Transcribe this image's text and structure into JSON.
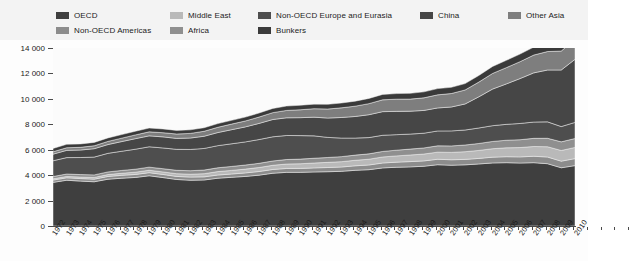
{
  "legend": {
    "rows": [
      [
        {
          "label": "OECD",
          "color": "#3f3f3f"
        },
        {
          "label": "Middle East",
          "color": "#b9b9b9"
        },
        {
          "label": "Non-OECD Europe and Eurasia",
          "color": "#4e4e4e"
        },
        {
          "label": "China",
          "color": "#464646"
        },
        {
          "label": "Other Asia",
          "color": "#7e7e7e"
        }
      ],
      [
        {
          "label": "Non-OECD Americas",
          "color": "#8c8c8c"
        },
        {
          "label": "Africa",
          "color": "#8f8f8f"
        },
        {
          "label": "Bunkers",
          "color": "#3a3a3a"
        }
      ]
    ]
  },
  "axes": {
    "y_ticks": [
      "0",
      "2 000",
      "4 000",
      "6 000",
      "8 000",
      "10 000",
      "12 000",
      "14 000"
    ],
    "y_min": 0,
    "y_max": 14000,
    "x_labels": [
      "1972",
      "1973",
      "1974",
      "1975",
      "1976",
      "1977",
      "1978",
      "1979",
      "1980",
      "1981",
      "1982",
      "1983",
      "1984",
      "1985",
      "1986",
      "1987",
      "1988",
      "1989",
      "1990",
      "1991",
      "1992",
      "1993",
      "1994",
      "1995",
      "1996",
      "1997",
      "1998",
      "1999",
      "2000",
      "2001",
      "2002",
      "2003",
      "2004",
      "2005",
      "2006",
      "2007",
      "2008",
      "2009",
      "2010"
    ]
  },
  "chart_data": {
    "type": "area",
    "title": "",
    "subtitle": "",
    "xlabel": "",
    "ylabel": "",
    "ylim": [
      0,
      14000
    ],
    "grid": false,
    "legend_position": "top",
    "stacked": true,
    "x": [
      "1972",
      "1973",
      "1974",
      "1975",
      "1976",
      "1977",
      "1978",
      "1979",
      "1980",
      "1981",
      "1982",
      "1983",
      "1984",
      "1985",
      "1986",
      "1987",
      "1988",
      "1989",
      "1990",
      "1991",
      "1992",
      "1993",
      "1994",
      "1995",
      "1996",
      "1997",
      "1998",
      "1999",
      "2000",
      "2001",
      "2002",
      "2003",
      "2004",
      "2005",
      "2006",
      "2007",
      "2008",
      "2009",
      "2010"
    ],
    "series": [
      {
        "name": "OECD",
        "color": "#3f3f3f",
        "values": [
          3430,
          3600,
          3530,
          3480,
          3680,
          3760,
          3820,
          3950,
          3810,
          3660,
          3600,
          3620,
          3760,
          3830,
          3900,
          4000,
          4150,
          4220,
          4220,
          4250,
          4270,
          4300,
          4380,
          4430,
          4570,
          4620,
          4650,
          4700,
          4820,
          4780,
          4810,
          4880,
          4960,
          4980,
          4950,
          4980,
          4900,
          4580,
          4750
        ]
      },
      {
        "name": "Non-OECD Americas",
        "color": "#8c8c8c",
        "values": [
          180,
          190,
          200,
          205,
          215,
          225,
          235,
          245,
          245,
          240,
          245,
          245,
          250,
          260,
          275,
          285,
          295,
          305,
          310,
          320,
          330,
          340,
          355,
          370,
          385,
          400,
          415,
          420,
          430,
          430,
          430,
          435,
          455,
          470,
          485,
          505,
          525,
          520,
          550
        ]
      },
      {
        "name": "Middle East",
        "color": "#b9b9b9",
        "values": [
          100,
          110,
          120,
          135,
          150,
          165,
          180,
          190,
          200,
          215,
          230,
          250,
          270,
          285,
          300,
          315,
          330,
          350,
          365,
          385,
          405,
          420,
          435,
          455,
          475,
          495,
          520,
          540,
          560,
          580,
          605,
          630,
          665,
          700,
          735,
          770,
          810,
          840,
          880
        ]
      },
      {
        "name": "Africa",
        "color": "#8f8f8f",
        "values": [
          180,
          190,
          195,
          200,
          210,
          220,
          235,
          245,
          255,
          265,
          275,
          285,
          300,
          310,
          320,
          330,
          340,
          355,
          365,
          375,
          385,
          395,
          405,
          420,
          435,
          450,
          465,
          480,
          495,
          510,
          525,
          545,
          570,
          595,
          615,
          640,
          665,
          680,
          700
        ]
      },
      {
        "name": "Non-OECD Europe and Eurasia",
        "color": "#4e4e4e",
        "values": [
          1240,
          1290,
          1340,
          1400,
          1460,
          1510,
          1570,
          1600,
          1630,
          1650,
          1670,
          1700,
          1740,
          1780,
          1820,
          1870,
          1900,
          1890,
          1850,
          1760,
          1580,
          1460,
          1340,
          1280,
          1270,
          1220,
          1180,
          1160,
          1170,
          1180,
          1180,
          1220,
          1240,
          1250,
          1280,
          1280,
          1290,
          1200,
          1270
        ]
      },
      {
        "name": "China",
        "color": "#464646",
        "values": [
          520,
          570,
          590,
          660,
          690,
          760,
          830,
          860,
          870,
          860,
          900,
          960,
          1030,
          1110,
          1180,
          1270,
          1360,
          1390,
          1410,
          1470,
          1520,
          1620,
          1700,
          1800,
          1860,
          1830,
          1800,
          1790,
          1810,
          1880,
          2050,
          2450,
          2880,
          3180,
          3530,
          3870,
          4080,
          4450,
          4960
        ]
      },
      {
        "name": "Other Asia",
        "color": "#7e7e7e",
        "values": [
          190,
          205,
          215,
          230,
          250,
          270,
          295,
          315,
          330,
          345,
          365,
          390,
          415,
          440,
          465,
          500,
          540,
          580,
          620,
          665,
          710,
          760,
          810,
          870,
          930,
          960,
          950,
          990,
          1030,
          1060,
          1100,
          1160,
          1230,
          1280,
          1330,
          1400,
          1450,
          1490,
          1570
        ]
      },
      {
        "name": "Bunkers",
        "color": "#3a3a3a",
        "values": [
          260,
          270,
          265,
          265,
          275,
          280,
          290,
          300,
          295,
          285,
          280,
          280,
          290,
          295,
          305,
          315,
          330,
          345,
          355,
          360,
          370,
          380,
          395,
          410,
          425,
          440,
          455,
          470,
          490,
          490,
          500,
          520,
          550,
          575,
          600,
          630,
          650,
          640,
          680
        ]
      }
    ]
  }
}
